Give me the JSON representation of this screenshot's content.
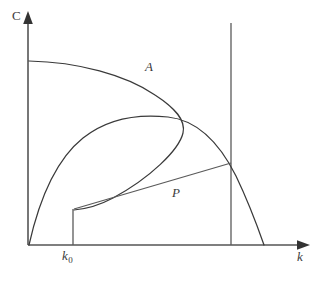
{
  "figure": {
    "kind": "economics-phase-diagram",
    "background_color": "#ffffff",
    "curve_color": "#3a3a3a",
    "axis_color": "#555555",
    "width": 320,
    "height": 281
  },
  "axes": {
    "vertical": {
      "label": "C",
      "name": "consumption-axis",
      "x": 28,
      "top_y": 14,
      "bottom_y": 245,
      "arrow": "up"
    },
    "horizontal": {
      "label": "k",
      "name": "capital-axis",
      "y": 245,
      "left_x": 28,
      "right_x": 310,
      "arrow": "right"
    }
  },
  "ticks": {
    "k0": {
      "label": "k",
      "subscript": "0",
      "x": 73,
      "label_x": 62,
      "label_y": 249
    }
  },
  "curves": [
    {
      "name": "saddle-path-A",
      "label": "A",
      "label_x": 145,
      "label_y": 60,
      "description": "backward-bending stable arm starting high on the C axis, bending right then descending to k0",
      "path": "M 29,61 C 78,62 126,75 155,95 C 175,108 186,120 183,133 C 179,150 150,178 113,198 C 100,205 85,209 74,210"
    },
    {
      "name": "production-function-curve",
      "label": "",
      "description": "concave hump rising from the origin, peaking near the middle, falling to the k axis",
      "path": "M 29,245 C 40,196 58,158 83,138 C 108,118 140,114 168,117 C 196,120 218,140 236,176 C 248,201 257,225 264,245"
    }
  ],
  "segments": [
    {
      "name": "k0-vertical-segment",
      "description": "vertical drop from the start of path P down to the k axis at k0",
      "x1": 73,
      "y1": 209,
      "x2": 73,
      "y2": 245
    },
    {
      "name": "path-P-line",
      "label": "P",
      "label_x": 172,
      "label_y": 186,
      "description": "straight transition path from (k0, c0) up to the steady state on the vertical line",
      "x1": 74,
      "y1": 209,
      "x2": 231,
      "y2": 163
    },
    {
      "name": "steady-state-vertical-line",
      "description": "vertical line marking the steady state capital stock",
      "x1": 231,
      "y1": 23,
      "x2": 231,
      "y2": 245
    }
  ],
  "labels": {
    "axis_c": "C",
    "axis_k": "k",
    "curve_a": "A",
    "path_p": "P",
    "tick_k0_base": "k",
    "tick_k0_sub": "0"
  }
}
